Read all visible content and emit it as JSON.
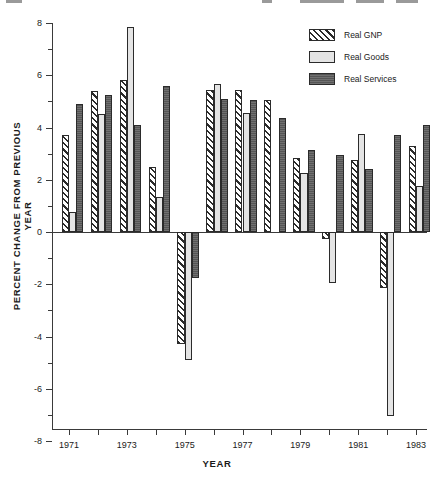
{
  "chart_data": {
    "type": "bar",
    "title": "",
    "xlabel": "YEAR",
    "ylabel": "PERCENT CHANGE FROM PREVIOUS YEAR",
    "categories": [
      "1971",
      "1972",
      "1973",
      "1974",
      "1975",
      "1976",
      "1977",
      "1978",
      "1979",
      "1980",
      "1981",
      "1982",
      "1983"
    ],
    "tick_labels_shown": [
      "1971",
      "1973",
      "1975",
      "1977",
      "1979",
      "1981",
      "1983"
    ],
    "ylim": [
      -8,
      8
    ],
    "yticks_major": [
      -8,
      -6,
      -4,
      -2,
      0,
      2,
      4,
      6,
      8
    ],
    "yticks_minor": [
      -7,
      -5,
      -3,
      -1,
      1,
      3,
      5,
      7
    ],
    "grid": false,
    "legend_position": "top-right",
    "series": [
      {
        "name": "Real GNP",
        "pattern": "diagonal-hatch",
        "color": "#ffffff",
        "values": [
          3.7,
          5.4,
          5.8,
          2.5,
          -4.3,
          5.45,
          5.45,
          5.05,
          2.85,
          -0.25,
          2.75,
          -2.15,
          3.3
        ]
      },
      {
        "name": "Real Goods",
        "pattern": "light-solid",
        "color": "#e4e4e4",
        "values": [
          0.75,
          4.5,
          7.85,
          1.35,
          -4.9,
          5.65,
          4.55,
          null,
          2.25,
          -1.95,
          3.75,
          -7.05,
          1.75
        ]
      },
      {
        "name": "Real Services",
        "pattern": "dark-solid",
        "color": "#555555",
        "values": [
          4.9,
          5.25,
          4.1,
          5.6,
          -1.75,
          5.1,
          5.05,
          4.35,
          3.15,
          2.95,
          2.4,
          3.7,
          4.1
        ]
      }
    ]
  },
  "legend": {
    "items": [
      {
        "label": "Real GNP",
        "key": "gnp"
      },
      {
        "label": "Real Goods",
        "key": "goods"
      },
      {
        "label": "Real Services",
        "key": "services"
      }
    ]
  },
  "axes": {
    "y_title": "PERCENT CHANGE FROM PREVIOUS YEAR",
    "x_title": "YEAR"
  }
}
